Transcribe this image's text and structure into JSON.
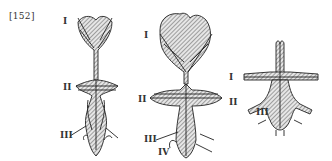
{
  "figure": {
    "number": "[152]",
    "diagrams": [
      {
        "id": "left",
        "labels": [
          "I",
          "II",
          "III"
        ]
      },
      {
        "id": "middle",
        "labels": [
          "I",
          "II",
          "III",
          "IV"
        ]
      },
      {
        "id": "right",
        "labels": [
          "I",
          "II",
          "III"
        ]
      }
    ]
  }
}
